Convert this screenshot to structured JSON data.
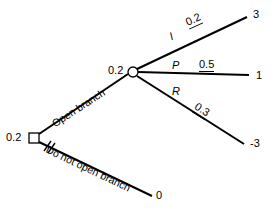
{
  "diagram": {
    "type": "decision-tree",
    "decision_node": {
      "shape": "square",
      "value_label": "0.2",
      "x": 34,
      "y": 138
    },
    "chance_node": {
      "shape": "circle",
      "value_label": "0.2",
      "x": 133,
      "y": 72
    },
    "decision_branches": [
      {
        "id": "open",
        "label": "Open branch",
        "pruned": false,
        "leads_to": "chance-node"
      },
      {
        "id": "do-not-open",
        "label": "Do not open branch",
        "pruned": true,
        "pruned_marker": "double-slash",
        "terminal_value": "0"
      }
    ],
    "chance_branches": [
      {
        "id": "I",
        "event": "I",
        "probability": "0.2",
        "terminal_value": "3"
      },
      {
        "id": "P",
        "event": "P",
        "probability": "0.5",
        "terminal_value": "1"
      },
      {
        "id": "R",
        "event": "R",
        "probability": "0.3",
        "terminal_value": "-3"
      }
    ],
    "colors": {
      "line": "#000000",
      "text": "#000000",
      "background": "#ffffff"
    }
  }
}
